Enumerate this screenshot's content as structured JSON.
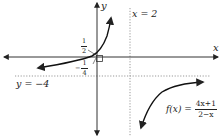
{
  "diagram": {
    "type": "function-graph",
    "axes": {
      "x_label": "x",
      "y_label": "y"
    },
    "asymptotes": {
      "vertical_label": "x = 2",
      "horizontal_label": "y = −4"
    },
    "intercepts": {
      "y_intercept_num": "1",
      "y_intercept_den": "2",
      "x_intercept_sign": "−",
      "x_intercept_num": "1",
      "x_intercept_den": "4"
    },
    "function": {
      "lhs": "f(x) =",
      "numerator": "4x+1",
      "denominator": "2−x"
    },
    "colors": {
      "axis": "#333333",
      "curve": "#111111",
      "asymptote": "#999999"
    }
  }
}
